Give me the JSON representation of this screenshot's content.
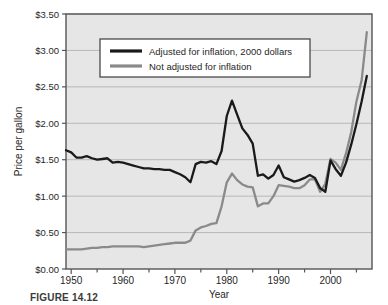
{
  "figure": {
    "caption": "FIGURE 14.12",
    "axis_label_y": "Price per gallon",
    "axis_label_x": "Year",
    "y_ticks": [
      "$0.00",
      "$0.50",
      "$1.00",
      "$1.50",
      "$2.00",
      "$2.50",
      "$3.00",
      "$3.50"
    ],
    "x_ticks": [
      "1950",
      "1960",
      "1970",
      "1980",
      "1990",
      "2000"
    ],
    "legend": {
      "items": [
        {
          "label": "Adjusted for inflation, 2000 dollars",
          "color": "#1a1a1a"
        },
        {
          "label": "Not adjusted for inflation",
          "color": "#8a8a8a"
        }
      ]
    }
  },
  "colors": {
    "plot_background": "#e6e6e6",
    "grid": "#b8b8b8",
    "axis": "#555555",
    "text": "#1f1f1f",
    "adjusted_line": "#1a1a1a",
    "nominal_line": "#8a8a8a",
    "legend_background": "#ffffff",
    "legend_border": "#4a4a4a"
  },
  "chart_data": {
    "type": "line",
    "title": "",
    "xlabel": "Year",
    "ylabel": "Price per gallon",
    "xlim": [
      1949,
      2008
    ],
    "ylim": [
      0.0,
      3.5
    ],
    "grid": true,
    "legend_position": "top-center",
    "x_tick_values": [
      1950,
      1960,
      1970,
      1980,
      1990,
      2000
    ],
    "x_minor_tick_interval": 5,
    "y_tick_values": [
      0.0,
      0.5,
      1.0,
      1.5,
      2.0,
      2.5,
      3.0,
      3.5
    ],
    "x": [
      1949,
      1950,
      1951,
      1952,
      1953,
      1954,
      1955,
      1956,
      1957,
      1958,
      1959,
      1960,
      1961,
      1962,
      1963,
      1964,
      1965,
      1966,
      1967,
      1968,
      1969,
      1970,
      1971,
      1972,
      1973,
      1974,
      1975,
      1976,
      1977,
      1978,
      1979,
      1980,
      1981,
      1982,
      1983,
      1984,
      1985,
      1986,
      1987,
      1988,
      1989,
      1990,
      1991,
      1992,
      1993,
      1994,
      1995,
      1996,
      1997,
      1998,
      1999,
      2000,
      2001,
      2002,
      2003,
      2004,
      2005,
      2006,
      2007
    ],
    "series": [
      {
        "name": "Adjusted for inflation, 2000 dollars",
        "color": "#1a1a1a",
        "values": [
          1.63,
          1.6,
          1.53,
          1.53,
          1.55,
          1.52,
          1.5,
          1.51,
          1.52,
          1.46,
          1.47,
          1.46,
          1.44,
          1.42,
          1.4,
          1.38,
          1.38,
          1.37,
          1.37,
          1.36,
          1.36,
          1.33,
          1.3,
          1.26,
          1.19,
          1.44,
          1.47,
          1.46,
          1.48,
          1.44,
          1.62,
          2.1,
          2.31,
          2.12,
          1.93,
          1.84,
          1.72,
          1.28,
          1.3,
          1.24,
          1.29,
          1.42,
          1.26,
          1.23,
          1.2,
          1.22,
          1.25,
          1.29,
          1.25,
          1.11,
          1.06,
          1.49,
          1.37,
          1.28,
          1.46,
          1.71,
          1.99,
          2.3,
          2.65
        ]
      },
      {
        "name": "Not adjusted for inflation",
        "color": "#8a8a8a",
        "values": [
          0.27,
          0.27,
          0.27,
          0.27,
          0.28,
          0.29,
          0.29,
          0.3,
          0.3,
          0.31,
          0.31,
          0.31,
          0.31,
          0.31,
          0.31,
          0.3,
          0.31,
          0.32,
          0.33,
          0.34,
          0.35,
          0.36,
          0.36,
          0.36,
          0.39,
          0.53,
          0.57,
          0.59,
          0.62,
          0.63,
          0.86,
          1.19,
          1.31,
          1.22,
          1.16,
          1.13,
          1.12,
          0.86,
          0.9,
          0.9,
          1.0,
          1.15,
          1.14,
          1.13,
          1.11,
          1.11,
          1.15,
          1.23,
          1.23,
          1.06,
          1.17,
          1.51,
          1.46,
          1.36,
          1.59,
          1.88,
          2.3,
          2.59,
          3.25
        ]
      }
    ]
  }
}
